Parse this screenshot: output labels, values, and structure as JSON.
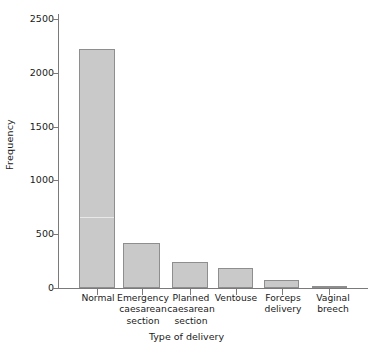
{
  "chart_data": {
    "type": "bar",
    "title": "",
    "xlabel": "Type of delivery",
    "ylabel": "Frequency",
    "categories": [
      "Normal",
      "Emergency caesarean section",
      "Planned caesarean section",
      "Ventouse",
      "Forceps delivery",
      "Vaginal breech"
    ],
    "category_lines": [
      [
        "Normal"
      ],
      [
        "Emergency",
        "caesarean",
        "section"
      ],
      [
        "Planned",
        "caesarean",
        "section"
      ],
      [
        "Ventouse"
      ],
      [
        "Forceps",
        "delivery"
      ],
      [
        "Vaginal",
        "breech"
      ]
    ],
    "values": [
      2220,
      420,
      240,
      190,
      70,
      20
    ],
    "ylim": [
      0,
      2650
    ],
    "yticks": [
      0,
      500,
      1000,
      1500,
      2000,
      2500
    ],
    "ytick_labels": [
      "0",
      "500",
      "1000",
      "1500",
      "2000",
      "2500"
    ],
    "grid": false,
    "legend": null,
    "bar_fill": "#c9c9c9",
    "bar_edge": "#8e8e8e",
    "axis_color": "#7a7a7a",
    "background": "#ffffff"
  }
}
